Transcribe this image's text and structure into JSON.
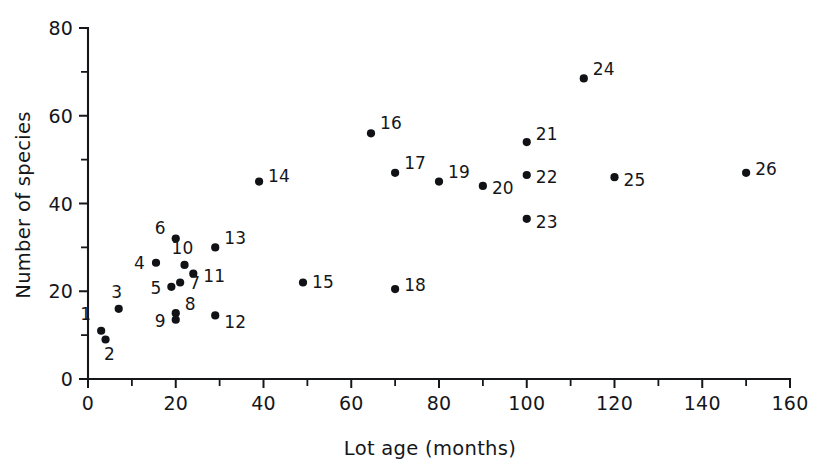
{
  "chart_data": {
    "type": "scatter",
    "title": "",
    "xlabel": "Lot age (months)",
    "ylabel": "Number of species",
    "xlim": [
      0,
      160
    ],
    "ylim": [
      0,
      80
    ],
    "x_ticks": [
      0,
      20,
      40,
      60,
      80,
      100,
      120,
      140,
      160
    ],
    "x_ticks_minor": [
      10,
      30,
      50,
      70,
      90,
      110,
      130,
      150
    ],
    "y_ticks": [
      0,
      20,
      40,
      60,
      80
    ],
    "y_ticks_minor": [
      10,
      30,
      50,
      70
    ],
    "grid": false,
    "legend": "none",
    "marker": "filled-circle",
    "marker_color": "#111215",
    "point_label_position": "adjacent",
    "points": [
      {
        "label": "1",
        "x": 3,
        "y": 11,
        "lx": -10,
        "ly": -11,
        "anchor": "end"
      },
      {
        "label": "2",
        "x": 4,
        "y": 9,
        "lx": 4,
        "ly": 20,
        "anchor": "middle"
      },
      {
        "label": "3",
        "x": 7,
        "y": 16,
        "lx": -2,
        "ly": -11,
        "anchor": "middle"
      },
      {
        "label": "4",
        "x": 15.5,
        "y": 26.5,
        "lx": -11,
        "ly": 6,
        "anchor": "end"
      },
      {
        "label": "5",
        "x": 19,
        "y": 21,
        "lx": -10,
        "ly": 7,
        "anchor": "end"
      },
      {
        "label": "6",
        "x": 20,
        "y": 32,
        "lx": -10,
        "ly": -5,
        "anchor": "end"
      },
      {
        "label": "7",
        "x": 21,
        "y": 22,
        "lx": 9,
        "ly": 7,
        "anchor": "start"
      },
      {
        "label": "8",
        "x": 20,
        "y": 15,
        "lx": 9,
        "ly": -3,
        "anchor": "start"
      },
      {
        "label": "9",
        "x": 20,
        "y": 13.5,
        "lx": -10,
        "ly": 7,
        "anchor": "end"
      },
      {
        "label": "10",
        "x": 22,
        "y": 26,
        "lx": -2,
        "ly": -11,
        "anchor": "middle"
      },
      {
        "label": "11",
        "x": 24,
        "y": 24,
        "lx": 10,
        "ly": 8,
        "anchor": "start"
      },
      {
        "label": "12",
        "x": 29,
        "y": 14.5,
        "lx": 9,
        "ly": 13,
        "anchor": "start"
      },
      {
        "label": "13",
        "x": 29,
        "y": 30,
        "lx": 9,
        "ly": -3,
        "anchor": "start"
      },
      {
        "label": "14",
        "x": 39,
        "y": 45,
        "lx": 9,
        "ly": 0,
        "anchor": "start"
      },
      {
        "label": "15",
        "x": 49,
        "y": 22,
        "lx": 9,
        "ly": 6,
        "anchor": "start"
      },
      {
        "label": "16",
        "x": 64.5,
        "y": 56,
        "lx": 9,
        "ly": -4,
        "anchor": "start"
      },
      {
        "label": "17",
        "x": 70,
        "y": 47,
        "lx": 9,
        "ly": -4,
        "anchor": "start"
      },
      {
        "label": "18",
        "x": 70,
        "y": 20.5,
        "lx": 9,
        "ly": 2,
        "anchor": "start"
      },
      {
        "label": "19",
        "x": 80,
        "y": 45,
        "lx": 9,
        "ly": -4,
        "anchor": "start"
      },
      {
        "label": "20",
        "x": 90,
        "y": 44,
        "lx": 9,
        "ly": 8,
        "anchor": "start"
      },
      {
        "label": "21",
        "x": 100,
        "y": 54,
        "lx": 9,
        "ly": -2,
        "anchor": "start"
      },
      {
        "label": "22",
        "x": 100,
        "y": 46.5,
        "lx": 9,
        "ly": 8,
        "anchor": "start"
      },
      {
        "label": "23",
        "x": 100,
        "y": 36.5,
        "lx": 9,
        "ly": 9,
        "anchor": "start"
      },
      {
        "label": "24",
        "x": 113,
        "y": 68.5,
        "lx": 9,
        "ly": -3,
        "anchor": "start"
      },
      {
        "label": "25",
        "x": 120,
        "y": 46,
        "lx": 9,
        "ly": 9,
        "anchor": "start"
      },
      {
        "label": "26",
        "x": 150,
        "y": 47,
        "lx": 9,
        "ly": 2,
        "anchor": "start"
      }
    ]
  },
  "axes": {
    "x_title": "Lot age (months)",
    "y_title": "Number of species",
    "x_tick_labels": [
      "0",
      "20",
      "40",
      "60",
      "80",
      "100",
      "120",
      "140",
      "160"
    ],
    "y_tick_labels": [
      "0",
      "20",
      "40",
      "60",
      "80"
    ]
  },
  "colors": {
    "marker": "#111215",
    "axis": "#16171a",
    "text": "#15161a",
    "background": "#ffffff"
  }
}
